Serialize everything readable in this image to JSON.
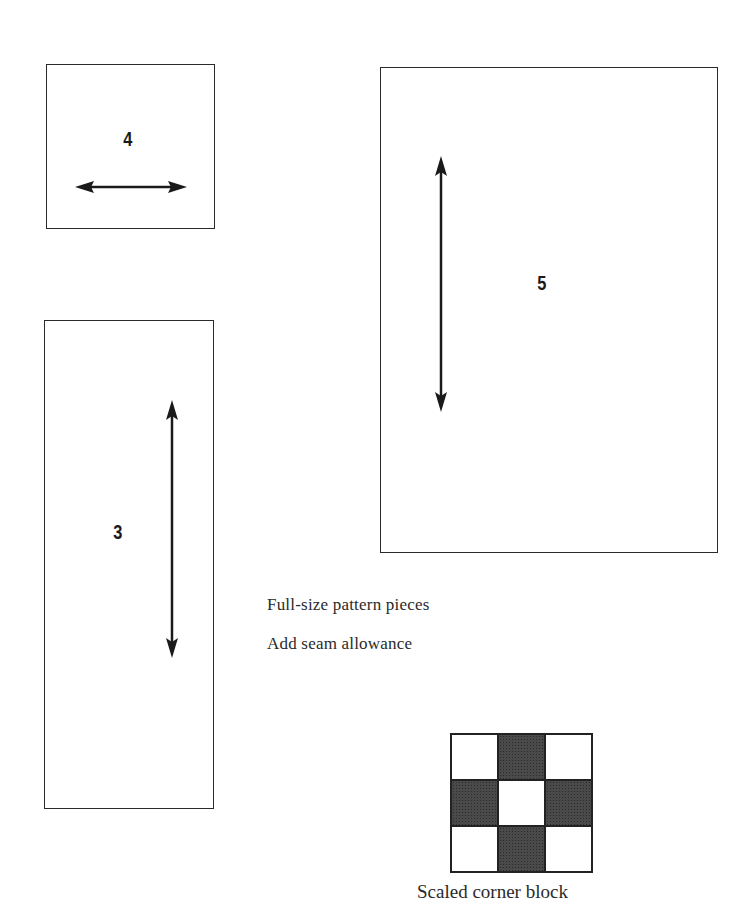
{
  "pieces": [
    {
      "id": "4",
      "label": "4",
      "grainline": "horizontal"
    },
    {
      "id": "5",
      "label": "5",
      "grainline": "vertical"
    },
    {
      "id": "3",
      "label": "3",
      "grainline": "vertical"
    }
  ],
  "notes": {
    "line1": "Full-size pattern pieces",
    "line2": "Add seam allowance"
  },
  "corner_block": {
    "caption": "Scaled corner block",
    "grid": [
      [
        "light",
        "dark",
        "light"
      ],
      [
        "dark",
        "light",
        "dark"
      ],
      [
        "light",
        "dark",
        "light"
      ]
    ],
    "colors": {
      "dark": "#4a4a4a",
      "light": "#ffffff",
      "outline": "#222222"
    }
  }
}
